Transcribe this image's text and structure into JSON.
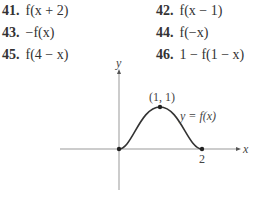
{
  "exercises": [
    {
      "number": "41.",
      "expr": "f(x + 2)"
    },
    {
      "number": "42.",
      "expr": "f(x − 1)"
    },
    {
      "number": "43.",
      "expr": "−f(x)"
    },
    {
      "number": "44.",
      "expr": "f(−x)"
    },
    {
      "number": "45.",
      "expr": "f(4 − x)"
    },
    {
      "number": "46.",
      "expr": "1 − f(1 − x)"
    }
  ],
  "graph": {
    "x_axis_label": "x",
    "y_axis_label": "y",
    "peak_label": "(1, 1)",
    "curve_label": "y = f(x)",
    "tick_label_2": "2"
  }
}
